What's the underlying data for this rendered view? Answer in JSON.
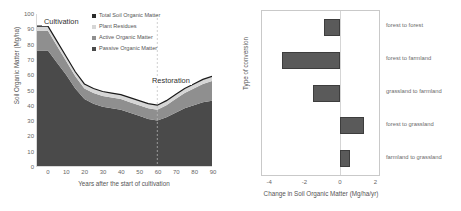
{
  "chart_data": [
    {
      "type": "area",
      "id": "soil-organic-matter-over-time",
      "title": "",
      "xlabel": "Years after the start of cultivation",
      "ylabel": "Soil Organic Matter (Mg/ha)",
      "xlim": [
        -6,
        90
      ],
      "ylim": [
        0,
        100
      ],
      "xticks": [
        0,
        10,
        20,
        30,
        40,
        50,
        60,
        70,
        80,
        90
      ],
      "yticks": [
        0,
        10,
        20,
        30,
        40,
        50,
        60,
        70,
        80,
        90,
        100
      ],
      "grid": false,
      "stacked": true,
      "legend_position": "inside-top-center",
      "annotations": [
        {
          "text": "Cultivation",
          "x": 2,
          "y": 97
        },
        {
          "text": "Restoration",
          "x": 60,
          "y": 62
        }
      ],
      "divider_x": 60,
      "x": [
        -6,
        0,
        5,
        10,
        15,
        20,
        25,
        30,
        35,
        40,
        45,
        50,
        55,
        60,
        65,
        70,
        75,
        80,
        85,
        90
      ],
      "series": [
        {
          "name": "Passive Organic Matter",
          "color": "#4a4a4a",
          "values": [
            76,
            76,
            68,
            60,
            51,
            44,
            41,
            39,
            38,
            37,
            35,
            33,
            31,
            30,
            32,
            35,
            38,
            40,
            42,
            43
          ]
        },
        {
          "name": "Active Organic Matter",
          "color": "#8f8f8f",
          "values": [
            13,
            13,
            11,
            9,
            8,
            7,
            7,
            7,
            7,
            7,
            7,
            7,
            7,
            7,
            8,
            9,
            10,
            11,
            12,
            13
          ]
        },
        {
          "name": "Plant Residues",
          "color": "#d6d6d6",
          "values": [
            3,
            3,
            3,
            3,
            3,
            3,
            3,
            3,
            3,
            3,
            3,
            3,
            3,
            3,
            3,
            3,
            3,
            3,
            3,
            3
          ]
        }
      ],
      "total_line": {
        "name": "Total Soil Organic Matter",
        "color": "#1a1a1a",
        "values": [
          92,
          92,
          82,
          72,
          62,
          54,
          51,
          49,
          48,
          47,
          45,
          43,
          41,
          40,
          43,
          47,
          51,
          54,
          57,
          59
        ]
      }
    },
    {
      "type": "bar",
      "id": "change-in-soil-organic-matter-by-conversion",
      "orientation": "horizontal",
      "title": "",
      "xlabel": "Change in Soil Organic Matter (Mg/ha/yr)",
      "ylabel": "Type of conversion",
      "xlim": [
        -4.4,
        2.2
      ],
      "xticks": [
        -4,
        -2,
        0,
        2
      ],
      "xtick_labels": [
        "-4",
        "-2",
        "0",
        "2"
      ],
      "grid": false,
      "bar_color": "#5a5a5a",
      "bar_edge_color": "#3d3d3d",
      "categories": [
        "forest to forest",
        "forest to farmland",
        "grassland to farmland",
        "forest to grassland",
        "farmland to grassland"
      ],
      "values": [
        -0.9,
        -3.3,
        -1.5,
        1.35,
        0.55
      ]
    }
  ],
  "left_chart": {
    "ylabel": "Soil Organic Matter (Mg/ha)",
    "xlabel": "Years after the start of cultivation",
    "yticks": [
      "100",
      "90",
      "80",
      "70",
      "60",
      "50",
      "40",
      "30",
      "20",
      "10",
      "0"
    ],
    "xticks": [
      "0",
      "10",
      "20",
      "30",
      "40",
      "50",
      "60",
      "70",
      "80",
      "90"
    ],
    "annotation_cultivation": "Cultivation",
    "annotation_restoration": "Restoration",
    "legend": [
      {
        "label": "Total Soil Organic Matter",
        "color": "#2b2b2b"
      },
      {
        "label": "Plant Residues",
        "color": "#d6d6d6"
      },
      {
        "label": "Active Organic Matter",
        "color": "#8f8f8f"
      },
      {
        "label": "Passive Organic Matter",
        "color": "#4a4a4a"
      }
    ]
  },
  "right_chart": {
    "ylabel": "Type of conversion",
    "xlabel": "Change in Soil Organic Matter (Mg/ha/yr)",
    "xticks": [
      "-4",
      "-2",
      "0",
      "2"
    ],
    "categories": [
      "forest to forest",
      "forest to farmland",
      "grassland to farmland",
      "forest to grassland",
      "farmland to grassland"
    ]
  }
}
